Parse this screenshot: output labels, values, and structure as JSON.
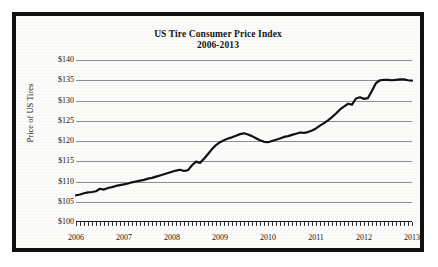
{
  "figure": {
    "border_color": "#111111",
    "background_color": "#fbfbfa"
  },
  "chart_data": {
    "type": "line",
    "title": "US Tire Consumer Price Index",
    "subtitle": "2006-2013",
    "xlabel": "",
    "ylabel": "Price of US Tires",
    "xlim": [
      2006,
      2013
    ],
    "ylim": [
      100,
      140
    ],
    "ytick_labels": [
      "$140",
      "$135",
      "$130",
      "$125",
      "$120",
      "$115",
      "$110",
      "$105",
      "$100"
    ],
    "ytick_values": [
      140,
      135,
      130,
      125,
      120,
      115,
      110,
      105,
      100
    ],
    "xtick_labels": [
      "2006",
      "2007",
      "2008",
      "2009",
      "2010",
      "2011",
      "2012",
      "2013"
    ],
    "xtick_values": [
      2006,
      2007,
      2008,
      2009,
      2010,
      2011,
      2012,
      2013
    ],
    "grid": true,
    "legend": "none",
    "minor_xticks": "monthly",
    "line_color": "#111111",
    "line_width": 2.2,
    "series": [
      {
        "name": "Price of US Tires",
        "x": [
          2006.0,
          2006.083,
          2006.167,
          2006.25,
          2006.333,
          2006.417,
          2006.5,
          2006.583,
          2006.667,
          2006.75,
          2006.833,
          2006.917,
          2007.0,
          2007.083,
          2007.167,
          2007.25,
          2007.333,
          2007.417,
          2007.5,
          2007.583,
          2007.667,
          2007.75,
          2007.833,
          2007.917,
          2008.0,
          2008.083,
          2008.167,
          2008.25,
          2008.333,
          2008.417,
          2008.5,
          2008.583,
          2008.667,
          2008.75,
          2008.833,
          2008.917,
          2009.0,
          2009.083,
          2009.167,
          2009.25,
          2009.333,
          2009.417,
          2009.5,
          2009.583,
          2009.667,
          2009.75,
          2009.833,
          2009.917,
          2010.0,
          2010.083,
          2010.167,
          2010.25,
          2010.333,
          2010.417,
          2010.5,
          2010.583,
          2010.667,
          2010.75,
          2010.833,
          2010.917,
          2011.0,
          2011.083,
          2011.167,
          2011.25,
          2011.333,
          2011.417,
          2011.5,
          2011.583,
          2011.667,
          2011.75,
          2011.833,
          2011.917,
          2012.0,
          2012.083,
          2012.167,
          2012.25,
          2012.333,
          2012.417,
          2012.5,
          2012.583,
          2012.667,
          2012.75,
          2012.833,
          2012.917,
          2013.0
        ],
        "y": [
          106.6,
          106.8,
          107.1,
          107.3,
          107.4,
          107.6,
          108.2,
          108.0,
          108.4,
          108.6,
          108.9,
          109.1,
          109.3,
          109.5,
          109.8,
          110.0,
          110.2,
          110.4,
          110.7,
          110.9,
          111.2,
          111.5,
          111.8,
          112.1,
          112.4,
          112.7,
          112.9,
          112.6,
          112.8,
          114.0,
          114.9,
          114.6,
          115.6,
          116.8,
          118.0,
          119.0,
          119.7,
          120.2,
          120.6,
          120.9,
          121.3,
          121.7,
          121.9,
          121.6,
          121.2,
          120.7,
          120.2,
          119.8,
          119.7,
          120.0,
          120.3,
          120.6,
          121.0,
          121.2,
          121.5,
          121.8,
          122.1,
          122.0,
          122.2,
          122.6,
          123.1,
          123.8,
          124.4,
          125.1,
          125.9,
          126.8,
          127.8,
          128.5,
          129.2,
          129.0,
          130.5,
          130.8,
          130.4,
          130.6,
          132.4,
          134.3,
          135.0,
          135.1,
          135.1,
          135.0,
          135.1,
          135.2,
          135.2,
          135.0,
          134.9
        ]
      }
    ]
  }
}
